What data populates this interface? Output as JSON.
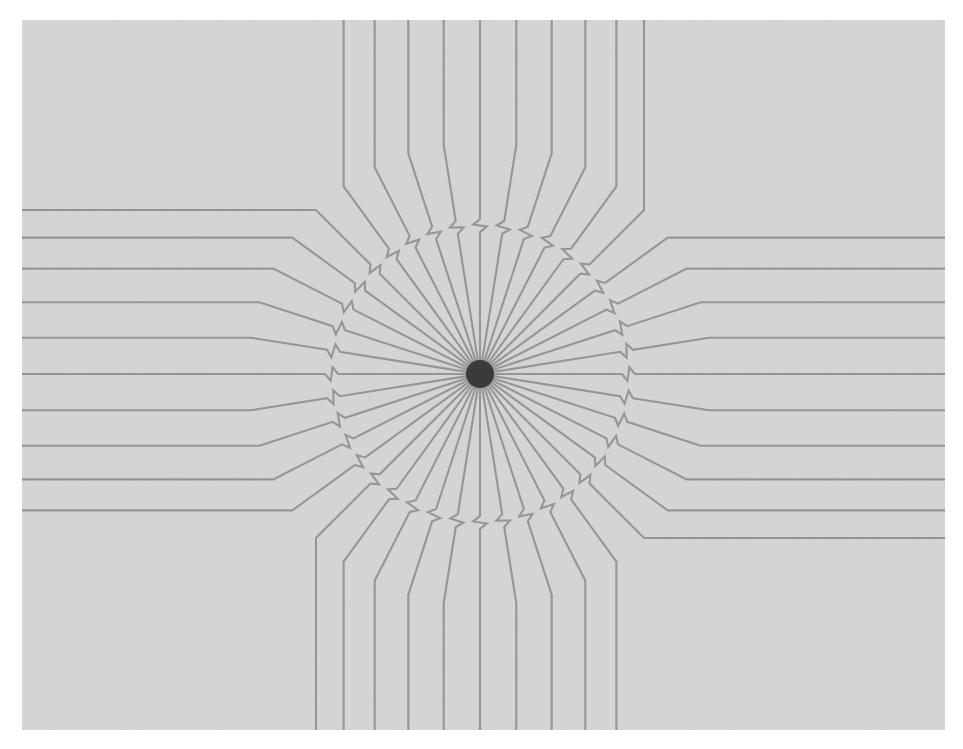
{
  "figure": {
    "type": "radial-line-diagram",
    "canvas": {
      "width": 963,
      "height": 749,
      "background_color": "#ffffff"
    },
    "panel": {
      "x": 22,
      "y": 20,
      "width": 923,
      "height": 710,
      "fill_color": "#d5d5d5",
      "noise": "light paper grain"
    },
    "hub": {
      "center_x": 480,
      "center_y": 374,
      "radius": 14,
      "color": "#3a3a3a",
      "description": "dense convergence point where all rays meet"
    },
    "rays": {
      "count": 40,
      "angle_step_deg": 9,
      "start_angle_deg": 0,
      "stroke_color": "#4a4a4a",
      "stroke_width": 2.1,
      "inner_radius": 12,
      "diagonal_end_radius": 232,
      "description": "Each ray runs radially out from the hub, carries a small zigzag switchback mark (X crossing) partway out, then bends to run straight to the panel edge."
    },
    "kink": {
      "name": "switchback-x-mark",
      "radius_fraction": 0.62,
      "size": 13,
      "description": "Small S/Z shaped reversal in the line that reads as a tiny crossed X on the stroke."
    },
    "edge_runs": {
      "description": "Outer portions of the rays flatten out and run parallel to the nearest panel edge (horizontal on left/right, vertical on top/bottom).",
      "left_edge_line_y": [
        29,
        58,
        96,
        140,
        194,
        253,
        318,
        433,
        495,
        550,
        601,
        645,
        686,
        715
      ],
      "right_edge_line_y": [
        29,
        58,
        96,
        140,
        194,
        253,
        318,
        433,
        495,
        550,
        601,
        645,
        686,
        715
      ]
    }
  },
  "chart_data": {
    "type": "line",
    "xlabel": "",
    "ylabel": "",
    "legend": [],
    "annotations": [
      "switchback-x-mark on each ray"
    ],
    "series": [
      {
        "name": "ray-0",
        "angle_deg": 0,
        "values": [
          0,
          232
        ]
      },
      {
        "name": "ray-1",
        "angle_deg": 9,
        "values": [
          0,
          232
        ]
      },
      {
        "name": "ray-2",
        "angle_deg": 18,
        "values": [
          0,
          232
        ]
      },
      {
        "name": "ray-3",
        "angle_deg": 27,
        "values": [
          0,
          232
        ]
      },
      {
        "name": "ray-4",
        "angle_deg": 36,
        "values": [
          0,
          232
        ]
      },
      {
        "name": "ray-5",
        "angle_deg": 45,
        "values": [
          0,
          232
        ]
      },
      {
        "name": "ray-6",
        "angle_deg": 54,
        "values": [
          0,
          232
        ]
      },
      {
        "name": "ray-7",
        "angle_deg": 63,
        "values": [
          0,
          232
        ]
      },
      {
        "name": "ray-8",
        "angle_deg": 72,
        "values": [
          0,
          232
        ]
      },
      {
        "name": "ray-9",
        "angle_deg": 81,
        "values": [
          0,
          232
        ]
      },
      {
        "name": "ray-10",
        "angle_deg": 90,
        "values": [
          0,
          232
        ]
      },
      {
        "name": "ray-11",
        "angle_deg": 99,
        "values": [
          0,
          232
        ]
      },
      {
        "name": "ray-12",
        "angle_deg": 108,
        "values": [
          0,
          232
        ]
      },
      {
        "name": "ray-13",
        "angle_deg": 117,
        "values": [
          0,
          232
        ]
      },
      {
        "name": "ray-14",
        "angle_deg": 126,
        "values": [
          0,
          232
        ]
      },
      {
        "name": "ray-15",
        "angle_deg": 135,
        "values": [
          0,
          232
        ]
      },
      {
        "name": "ray-16",
        "angle_deg": 144,
        "values": [
          0,
          232
        ]
      },
      {
        "name": "ray-17",
        "angle_deg": 153,
        "values": [
          0,
          232
        ]
      },
      {
        "name": "ray-18",
        "angle_deg": 162,
        "values": [
          0,
          232
        ]
      },
      {
        "name": "ray-19",
        "angle_deg": 171,
        "values": [
          0,
          232
        ]
      },
      {
        "name": "ray-20",
        "angle_deg": 180,
        "values": [
          0,
          232
        ]
      },
      {
        "name": "ray-21",
        "angle_deg": 189,
        "values": [
          0,
          232
        ]
      },
      {
        "name": "ray-22",
        "angle_deg": 198,
        "values": [
          0,
          232
        ]
      },
      {
        "name": "ray-23",
        "angle_deg": 207,
        "values": [
          0,
          232
        ]
      },
      {
        "name": "ray-24",
        "angle_deg": 216,
        "values": [
          0,
          232
        ]
      },
      {
        "name": "ray-25",
        "angle_deg": 225,
        "values": [
          0,
          232
        ]
      },
      {
        "name": "ray-26",
        "angle_deg": 234,
        "values": [
          0,
          232
        ]
      },
      {
        "name": "ray-27",
        "angle_deg": 243,
        "values": [
          0,
          232
        ]
      },
      {
        "name": "ray-28",
        "angle_deg": 252,
        "values": [
          0,
          232
        ]
      },
      {
        "name": "ray-29",
        "angle_deg": 261,
        "values": [
          0,
          232
        ]
      },
      {
        "name": "ray-30",
        "angle_deg": 270,
        "values": [
          0,
          232
        ]
      },
      {
        "name": "ray-31",
        "angle_deg": 279,
        "values": [
          0,
          232
        ]
      },
      {
        "name": "ray-32",
        "angle_deg": 288,
        "values": [
          0,
          232
        ]
      },
      {
        "name": "ray-33",
        "angle_deg": 297,
        "values": [
          0,
          232
        ]
      },
      {
        "name": "ray-34",
        "angle_deg": 306,
        "values": [
          0,
          232
        ]
      },
      {
        "name": "ray-35",
        "angle_deg": 315,
        "values": [
          0,
          232
        ]
      },
      {
        "name": "ray-36",
        "angle_deg": 324,
        "values": [
          0,
          232
        ]
      },
      {
        "name": "ray-37",
        "angle_deg": 333,
        "values": [
          0,
          232
        ]
      },
      {
        "name": "ray-38",
        "angle_deg": 342,
        "values": [
          0,
          232
        ]
      },
      {
        "name": "ray-39",
        "angle_deg": 351,
        "values": [
          0,
          232
        ]
      }
    ]
  }
}
